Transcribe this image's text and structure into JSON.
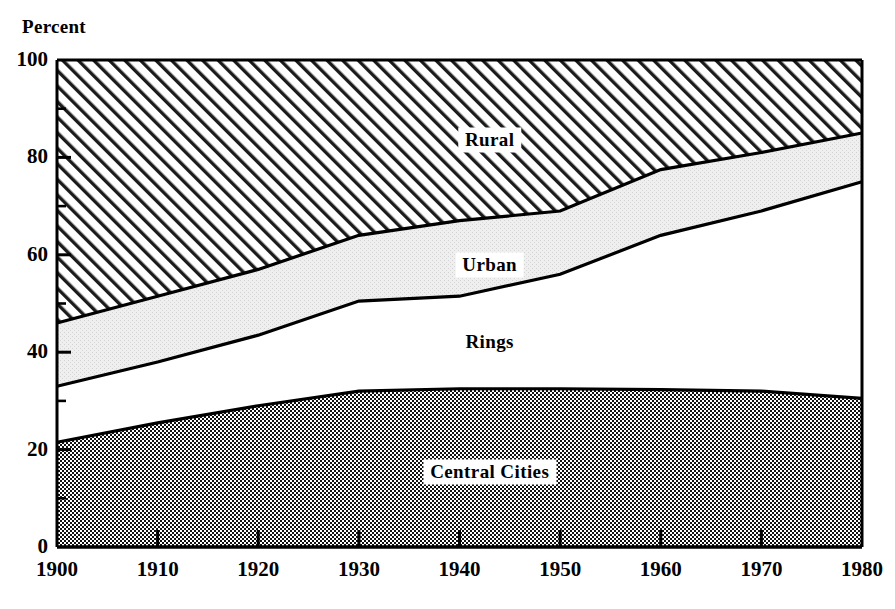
{
  "chart_data": {
    "type": "area",
    "title": "",
    "subtitle": "",
    "ylabel": "Percent",
    "xlabel": "",
    "stacked": true,
    "normalized_to_100": true,
    "grid": false,
    "legend_position": "inline-labels",
    "xlim": [
      1900,
      1980
    ],
    "ylim": [
      0,
      100
    ],
    "x_major_ticks": [
      1900,
      1910,
      1920,
      1930,
      1940,
      1950,
      1960,
      1970,
      1980
    ],
    "y_major_ticks": [
      0,
      20,
      40,
      60,
      80,
      100
    ],
    "y_minor_ticks": [
      10,
      30,
      50,
      70,
      90
    ],
    "x": [
      1900,
      1910,
      1920,
      1930,
      1940,
      1950,
      1960,
      1970,
      1980
    ],
    "series": [
      {
        "name": "Central Cities",
        "fill": "dark-checker",
        "values": [
          21.5,
          25.5,
          29.0,
          32.0,
          32.5,
          32.5,
          32.3,
          32.0,
          30.5
        ]
      },
      {
        "name": "Rings",
        "fill": "white",
        "values": [
          11.5,
          12.5,
          14.5,
          18.5,
          19.0,
          23.5,
          31.7,
          37.0,
          44.5
        ]
      },
      {
        "name": "Urban",
        "fill": "light-gray-stipple",
        "values": [
          13.0,
          13.5,
          13.5,
          13.5,
          15.5,
          13.0,
          13.5,
          12.0,
          10.0
        ]
      },
      {
        "name": "Rural",
        "fill": "diagonal-hatch",
        "values": [
          54.0,
          48.5,
          43.0,
          36.5,
          33.0,
          31.0,
          22.5,
          19.0,
          15.0
        ]
      }
    ],
    "cumulative_boundaries": {
      "central_cities_top": [
        21.5,
        25.5,
        29.0,
        32.0,
        32.5,
        32.5,
        32.3,
        32.0,
        30.5
      ],
      "rings_top": [
        33.0,
        38.0,
        43.5,
        50.5,
        51.5,
        56.0,
        64.0,
        69.0,
        75.0
      ],
      "urban_top": [
        46.0,
        51.5,
        57.0,
        64.0,
        67.0,
        69.0,
        77.5,
        81.0,
        85.0
      ],
      "rural_top": [
        100,
        100,
        100,
        100,
        100,
        100,
        100,
        100,
        100
      ]
    },
    "annotations": [
      {
        "text": "Rural",
        "x": 1943,
        "y": 83.5
      },
      {
        "text": "Urban",
        "x": 1943,
        "y": 58.0
      },
      {
        "text": "Rings",
        "x": 1943,
        "y": 42.0
      },
      {
        "text": "Central Cities",
        "x": 1943,
        "y": 15.5
      }
    ]
  },
  "colors": {
    "axis": "#000000",
    "background": "#ffffff",
    "rural_fill": "#ffffff",
    "rural_hatch": "#1a1a1a",
    "urban_fill": "#ededed",
    "rings_fill": "#ffffff",
    "central_cities_fill": "#8a8a8a",
    "central_cities_dot": "#141414"
  },
  "axes": {
    "y_title": "Percent",
    "y_labels": [
      "100",
      "80",
      "60",
      "40",
      "20",
      "0"
    ],
    "x_labels": [
      "1900",
      "1910",
      "1920",
      "1930",
      "1940",
      "1950",
      "1960",
      "1970",
      "1980"
    ]
  },
  "band_labels": {
    "rural": "Rural",
    "urban": "Urban",
    "rings": "Rings",
    "central_cities": "Central Cities"
  }
}
